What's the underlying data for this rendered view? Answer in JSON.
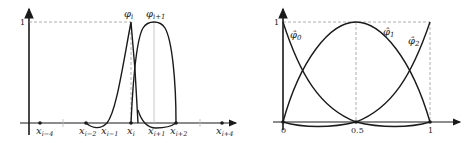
{
  "left_plot": {
    "y_tick_label": "1",
    "curve_labels": {
      "phi_i": "φ",
      "phi_i_sub": "i",
      "phi_i1": "φ",
      "phi_i1_sub": "i+1"
    },
    "x_labels": [
      {
        "base": "x",
        "sub": "i−4"
      },
      {
        "base": "x",
        "sub": "i−2"
      },
      {
        "base": "x",
        "sub": "i−1"
      },
      {
        "base": "x",
        "sub": "i"
      },
      {
        "base": "x",
        "sub": "i+1"
      },
      {
        "base": "x",
        "sub": "i+2"
      },
      {
        "base": "x",
        "sub": "i+4"
      }
    ]
  },
  "right_plot": {
    "y_tick_label": "1",
    "x_tick_labels": [
      "0",
      "0.5",
      "1"
    ],
    "curve_labels": [
      {
        "base": "φ̂",
        "sub": "0"
      },
      {
        "base": "φ̂",
        "sub": "1"
      },
      {
        "base": "φ̂",
        "sub": "2"
      }
    ]
  },
  "colors": {
    "curve": "#1a1a1a",
    "axis": "#1a1a1a",
    "guide": "#999999"
  }
}
